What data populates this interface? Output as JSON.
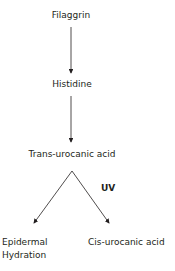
{
  "diagram": {
    "nodes": {
      "filaggrin": "Filaggrin",
      "histidine": "Histidine",
      "trans_urocanic": "Trans-urocanic acid",
      "epidermal_line1": "Epidermal",
      "epidermal_line2": "Hydration",
      "cis_urocanic": "Cis-urocanic acid"
    },
    "edge_labels": {
      "uv": "UV"
    },
    "edges": [
      {
        "from": "Filaggrin",
        "to": "Histidine"
      },
      {
        "from": "Histidine",
        "to": "Trans-urocanic acid"
      },
      {
        "from": "Trans-urocanic acid",
        "to": "Epidermal Hydration"
      },
      {
        "from": "Trans-urocanic acid",
        "to": "Cis-urocanic acid",
        "label": "UV"
      }
    ],
    "colors": {
      "line": "#231f20",
      "text": "#231f20",
      "background": "#ffffff"
    }
  }
}
